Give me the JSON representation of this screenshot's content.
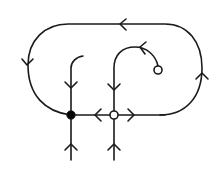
{
  "diagram": {
    "type": "phase-portrait",
    "colors": {
      "stroke": "#1a1a1a",
      "background": "#ffffff",
      "open_fill": "#ffffff",
      "filled": "#000000"
    },
    "nodes": [
      {
        "id": "filled-node",
        "kind": "filled",
        "x": 71,
        "y": 115
      },
      {
        "id": "open-node",
        "kind": "open",
        "x": 114,
        "y": 115
      },
      {
        "id": "source-circle",
        "kind": "open",
        "x": 158,
        "y": 70
      }
    ],
    "edges": [
      {
        "id": "outer-loop",
        "arrows": [
          "left on top",
          "down on left",
          "up on right"
        ]
      },
      {
        "id": "horizontal-axis",
        "arrows": [
          "left toward filled node",
          "right away from open node"
        ]
      },
      {
        "id": "left-vertical-upper",
        "arrows": [
          "down"
        ]
      },
      {
        "id": "left-vertical-lower",
        "arrows": [
          "up"
        ]
      },
      {
        "id": "middle-vertical-upper",
        "arrows": [
          "down"
        ]
      },
      {
        "id": "middle-vertical-lower",
        "arrows": [
          "up"
        ]
      },
      {
        "id": "spiral-from-circle",
        "arrows": [
          "left"
        ]
      }
    ]
  }
}
